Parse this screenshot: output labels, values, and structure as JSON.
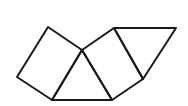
{
  "diagram": {
    "stroke_color": "#1a1a1a",
    "background": "#ffffff",
    "vertices": {
      "A": [
        48,
        27
      ],
      "B": [
        17,
        77
      ],
      "C": [
        52,
        100
      ],
      "D": [
        82,
        50
      ],
      "E": [
        112,
        100
      ],
      "F": [
        114,
        28
      ],
      "G": [
        143,
        79
      ],
      "H": [
        176,
        28
      ]
    },
    "shapes": [
      {
        "name": "left-square",
        "points": "48,27 17,77 52,100 82,50"
      },
      {
        "name": "bottom-triangle",
        "points": "52,100 82,50 112,100"
      },
      {
        "name": "middle-square",
        "points": "82,50 114,28 143,79 112,100"
      },
      {
        "name": "right-triangle",
        "points": "114,28 176,28 143,79"
      }
    ]
  }
}
